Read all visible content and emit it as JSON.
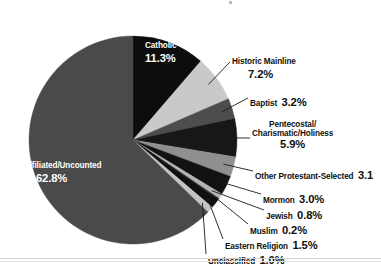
{
  "chart_data": {
    "type": "pie",
    "title": "",
    "subtitle": "",
    "xlabel": "",
    "ylabel": "",
    "legend_position": "none",
    "grid": false,
    "units": "percent",
    "categories": [
      "Catholic",
      "Historic Mainline",
      "Baptist",
      "Pentecostal/Charismatic/Holiness",
      "Other Protestant-Selected",
      "Mormon",
      "Jewish",
      "Muslim",
      "Eastern Religion",
      "Unclassified",
      "Unaffiliated/Uncounted"
    ],
    "values": [
      11.3,
      7.2,
      3.2,
      5.9,
      3.1,
      3.0,
      0.8,
      0.2,
      1.5,
      1.0,
      62.8
    ],
    "slices": [
      {
        "label": "Catholic",
        "value": 11.3,
        "value_text": "11.3%",
        "color": "#0d0d0d",
        "label_placement": "inside"
      },
      {
        "label": "Historic Mainline",
        "value": 7.2,
        "value_text": "7.2%",
        "color": "#c9c9c9",
        "label_placement": "outside"
      },
      {
        "label": "Baptist",
        "value": 3.2,
        "value_text": "3.2%",
        "color": "#4d4d4d",
        "label_placement": "outside"
      },
      {
        "label": "Pentecostal/Charismatic/Holiness",
        "value": 5.9,
        "value_text": "5.9%",
        "color": "#171717",
        "label_placement": "outside"
      },
      {
        "label": "Other Protestant-Selected",
        "value": 3.1,
        "value_text": "3.1",
        "color": "#8f8f8f",
        "label_placement": "outside"
      },
      {
        "label": "Mormon",
        "value": 3.0,
        "value_text": "3.0%",
        "color": "#121212",
        "label_placement": "outside"
      },
      {
        "label": "Jewish",
        "value": 0.8,
        "value_text": "0.8%",
        "color": "#b4b4b4",
        "label_placement": "outside"
      },
      {
        "label": "Muslim",
        "value": 0.2,
        "value_text": "0.2%",
        "color": "#2a2a2a",
        "label_placement": "outside"
      },
      {
        "label": "Eastern Religion",
        "value": 1.5,
        "value_text": "1.5%",
        "color": "#101010",
        "label_placement": "outside"
      },
      {
        "label": "Unclassified",
        "value": 1.0,
        "value_text": "1.0%",
        "color": "#c4c4c4",
        "label_placement": "outside"
      },
      {
        "label": "Unaffiliated/Uncounted",
        "value": 62.8,
        "value_text": "62.8%",
        "color": "#4a4a4a",
        "label_placement": "inside"
      }
    ],
    "start_angle_deg": 0,
    "direction": "clockwise",
    "total": 100.0
  },
  "labels": {
    "catholic": {
      "name": "Catholic",
      "pct": "11.3%"
    },
    "historic_mainline": {
      "name": "Historic Mainline",
      "pct": "7.2%"
    },
    "baptist": {
      "name": "Baptist",
      "pct": "3.2%"
    },
    "pentecostal": {
      "name_line1": "Pentecostal/",
      "name_line2": "Charismatic/Holiness",
      "pct": "5.9%"
    },
    "other_protestant": {
      "name": "Other Protestant-Selected",
      "pct": "3.1"
    },
    "mormon": {
      "name": "Mormon",
      "pct": "3.0%"
    },
    "jewish": {
      "name": "Jewish",
      "pct": "0.8%"
    },
    "muslim": {
      "name": "Muslim",
      "pct": "0.2%"
    },
    "eastern_religion": {
      "name": "Eastern Religion",
      "pct": "1.5%"
    },
    "unclassified": {
      "name": "Unclassified",
      "pct": "1.0%"
    },
    "unaffiliated": {
      "name": "Unaffiliated/Uncounted",
      "pct": "62.8%"
    }
  },
  "colors": {
    "background": "#ffffff",
    "text": "#101010",
    "text_on_dark": "#ffffff",
    "leader_line": "#1a1a1a",
    "rule": "#d2d2d2"
  },
  "geometry": {
    "cx": 133,
    "cy": 140,
    "r": 104
  }
}
